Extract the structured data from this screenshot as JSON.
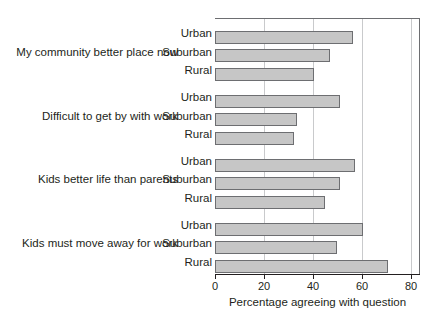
{
  "chart_data": {
    "type": "bar",
    "orientation": "horizontal",
    "title": "",
    "xlabel": "Percentage agreeing with question",
    "ylabel": "",
    "xlim": [
      0,
      80
    ],
    "xticks": [
      0,
      20,
      40,
      60,
      80
    ],
    "xtick_labels": [
      "0",
      "20",
      "40",
      "60",
      "80"
    ],
    "grid": true,
    "grid_axis": "x",
    "legend": "none",
    "bar_fill_color": "#c6c6c6",
    "bar_edge_color": "#6d6e71",
    "categories": [
      "My community better place now",
      "Difficult to get by with work",
      "Kids better life than parents",
      "Kids must move away for work"
    ],
    "subcategories": [
      "Urban",
      "Suburban",
      "Rural"
    ],
    "groups": [
      {
        "label": "My community better place now",
        "bars": [
          {
            "name": "Urban",
            "value": 54
          },
          {
            "name": "Suburban",
            "value": 45
          },
          {
            "name": "Rural",
            "value": 39
          }
        ]
      },
      {
        "label": "Difficult to get by with work",
        "bars": [
          {
            "name": "Urban",
            "value": 49
          },
          {
            "name": "Suburban",
            "value": 32
          },
          {
            "name": "Rural",
            "value": 31
          }
        ]
      },
      {
        "label": "Kids better life than parents",
        "bars": [
          {
            "name": "Urban",
            "value": 55
          },
          {
            "name": "Suburban",
            "value": 49
          },
          {
            "name": "Rural",
            "value": 43
          }
        ]
      },
      {
        "label": "Kids must move away for work",
        "bars": [
          {
            "name": "Urban",
            "value": 58
          },
          {
            "name": "Suburban",
            "value": 48
          },
          {
            "name": "Rural",
            "value": 68
          }
        ]
      }
    ]
  }
}
